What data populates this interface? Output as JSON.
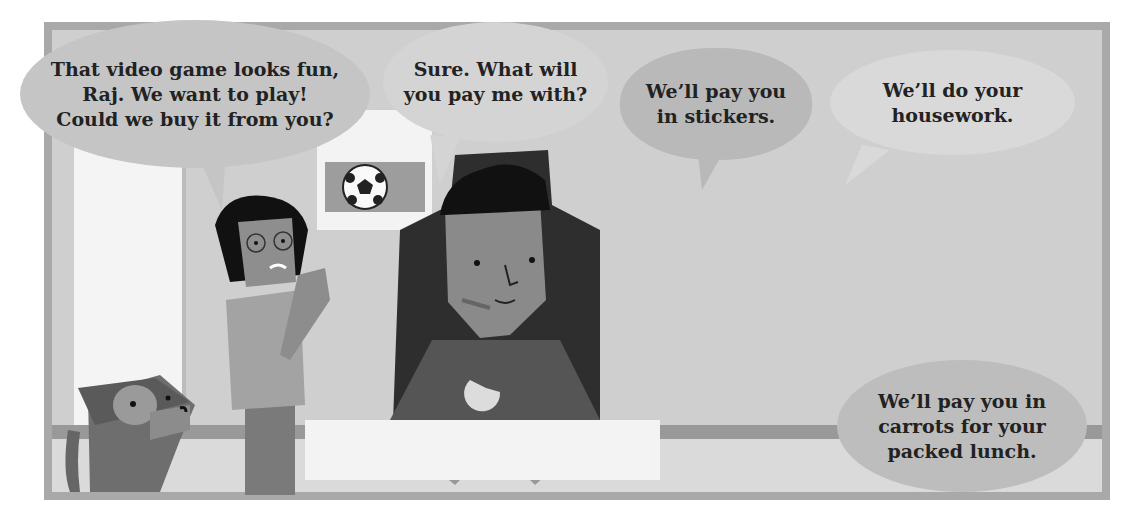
{
  "scene": {
    "description": "Comic panel: kids offering to trade for Raj's video game",
    "palette": {
      "frame": "#a9a9a9",
      "wall": "#cfcfcf",
      "bubble_light": "#d8d8d8",
      "bubble_mid": "#b8b8b8",
      "text": "#222222"
    }
  },
  "bubbles": [
    {
      "speaker": "girl-with-glasses",
      "text": "That video game looks fun, Raj. We want to play! Could we buy it from you?",
      "lines": [
        "That video game looks fun,",
        "Raj. We want to play!",
        "Could we buy it from you?"
      ]
    },
    {
      "speaker": "raj",
      "text": "Sure. What will you pay me with?",
      "lines": [
        "Sure. What will",
        "you pay me with?"
      ]
    },
    {
      "speaker": "blond-boy",
      "text": "We'll pay you in stickers.",
      "lines": [
        "We’ll pay you",
        "in stickers."
      ]
    },
    {
      "speaker": "boy-pointing",
      "text": "We'll do your housework.",
      "lines": [
        "We’ll do your",
        "housework."
      ]
    },
    {
      "speaker": "girl-with-buns",
      "text": "We'll pay you in carrots for your packed lunch.",
      "lines": [
        "We’ll pay you in",
        "carrots for your",
        "packed lunch."
      ]
    }
  ],
  "characters": [
    "dog",
    "girl-with-glasses",
    "raj",
    "blond-boy",
    "girl-with-buns",
    "boy-pointing"
  ],
  "props": [
    "door",
    "soccer-poster",
    "gaming-chair",
    "game-controller",
    "desk",
    "stickers"
  ]
}
